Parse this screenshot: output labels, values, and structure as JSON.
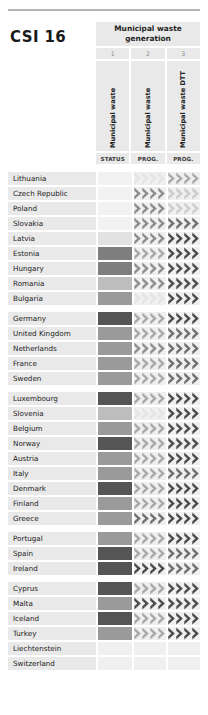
{
  "title": "CSI 16",
  "header": {
    "group_label": "Municipal waste generation",
    "columns": [
      {
        "num": "1",
        "vlabel": "Municipal waste",
        "sub": "STATUS"
      },
      {
        "num": "2",
        "vlabel": "Municipal waste",
        "sub": "PROG."
      },
      {
        "num": "3",
        "vlabel": "Municipal waste DTT",
        "sub": "PROG."
      }
    ]
  },
  "palette": {
    "empty": "#efefef",
    "row_bg": "#e9e9e9",
    "status_0": "#f2f2f2",
    "status_1": "#e2e2e2",
    "status_2": "#bdbdbd",
    "status_3": "#9a9a9a",
    "status_4": "#7e7e7e",
    "status_5": "#555555",
    "chev_0": "#e3e3e3",
    "chev_1": "#cccccc",
    "chev_2": "#a8a8a8",
    "chev_3": "#8c8c8c",
    "chev_4": "#6e6e6e",
    "chev_5": "#4a4a4a"
  },
  "chevron_count": 4,
  "groups": [
    {
      "rows": [
        {
          "name": "Lithuania",
          "status": "status_0",
          "prog1": [
            "chev_0",
            "chev_0",
            "chev_0",
            "chev_0"
          ],
          "prog2": [
            "chev_2",
            "chev_2",
            "chev_2",
            "chev_2"
          ]
        },
        {
          "name": "Czech Republic",
          "status": "status_0",
          "prog1": [
            "chev_3",
            "chev_3",
            "chev_3",
            "chev_3"
          ],
          "prog2": [
            "chev_1",
            "chev_1",
            "chev_1",
            "chev_1"
          ]
        },
        {
          "name": "Poland",
          "status": "status_0",
          "prog1": [
            "chev_3",
            "chev_3",
            "chev_3",
            "chev_3"
          ],
          "prog2": [
            "chev_1",
            "chev_1",
            "chev_1",
            "chev_1"
          ]
        },
        {
          "name": "Slovakia",
          "status": "status_0",
          "prog1": [
            "chev_3",
            "chev_3",
            "chev_3",
            "chev_3"
          ],
          "prog2": [
            "chev_4",
            "chev_4",
            "chev_4",
            "chev_4"
          ]
        },
        {
          "name": "Latvia",
          "status": "status_1",
          "prog1": [
            "chev_3",
            "chev_3",
            "chev_3",
            "chev_3"
          ],
          "prog2": [
            "chev_5",
            "chev_5",
            "chev_5",
            "chev_5"
          ]
        },
        {
          "name": "Estonia",
          "status": "status_4",
          "prog1": [
            "chev_2",
            "chev_2",
            "chev_2",
            "chev_2"
          ],
          "prog2": [
            "chev_5",
            "chev_5",
            "chev_5",
            "chev_5"
          ]
        },
        {
          "name": "Hungary",
          "status": "status_4",
          "prog1": [
            "chev_3",
            "chev_3",
            "chev_3",
            "chev_3"
          ],
          "prog2": [
            "chev_5",
            "chev_5",
            "chev_5",
            "chev_5"
          ]
        },
        {
          "name": "Romania",
          "status": "status_2",
          "prog1": [
            "chev_3",
            "chev_3",
            "chev_3",
            "chev_3"
          ],
          "prog2": [
            "chev_5",
            "chev_5",
            "chev_5",
            "chev_5"
          ]
        },
        {
          "name": "Bulgaria",
          "status": "status_3",
          "prog1": [
            "chev_0",
            "chev_0",
            "chev_0",
            "chev_0"
          ],
          "prog2": [
            "chev_5",
            "chev_5",
            "chev_5",
            "chev_5"
          ]
        }
      ]
    },
    {
      "rows": [
        {
          "name": "Germany",
          "status": "status_5",
          "prog1": [
            "chev_2",
            "chev_2",
            "chev_2",
            "chev_2"
          ],
          "prog2": [
            "chev_5",
            "chev_5",
            "chev_5",
            "chev_5"
          ]
        },
        {
          "name": "United Kingdom",
          "status": "status_3",
          "prog1": [
            "chev_2",
            "chev_2",
            "chev_2",
            "chev_2"
          ],
          "prog2": [
            "chev_4",
            "chev_4",
            "chev_4",
            "chev_4"
          ]
        },
        {
          "name": "Netherlands",
          "status": "status_3",
          "prog1": [
            "chev_3",
            "chev_3",
            "chev_3",
            "chev_3"
          ],
          "prog2": [
            "chev_4",
            "chev_4",
            "chev_4",
            "chev_4"
          ]
        },
        {
          "name": "France",
          "status": "status_3",
          "prog1": [
            "chev_2",
            "chev_2",
            "chev_2",
            "chev_2"
          ],
          "prog2": [
            "chev_4",
            "chev_4",
            "chev_4",
            "chev_4"
          ]
        },
        {
          "name": "Sweden",
          "status": "status_3",
          "prog1": [
            "chev_2",
            "chev_2",
            "chev_2",
            "chev_2"
          ],
          "prog2": [
            "chev_4",
            "chev_4",
            "chev_4",
            "chev_4"
          ]
        }
      ]
    },
    {
      "rows": [
        {
          "name": "Luxembourg",
          "status": "status_5",
          "prog1": [
            "chev_2",
            "chev_2",
            "chev_2",
            "chev_2"
          ],
          "prog2": [
            "chev_5",
            "chev_5",
            "chev_5",
            "chev_5"
          ]
        },
        {
          "name": "Slovenia",
          "status": "status_2",
          "prog1": [
            "chev_0",
            "chev_0",
            "chev_0",
            "chev_0"
          ],
          "prog2": [
            "chev_5",
            "chev_5",
            "chev_5",
            "chev_5"
          ]
        },
        {
          "name": "Belgium",
          "status": "status_3",
          "prog1": [
            "chev_2",
            "chev_2",
            "chev_2",
            "chev_2"
          ],
          "prog2": [
            "chev_5",
            "chev_5",
            "chev_5",
            "chev_5"
          ]
        },
        {
          "name": "Norway",
          "status": "status_5",
          "prog1": [
            "chev_2",
            "chev_2",
            "chev_2",
            "chev_2"
          ],
          "prog2": [
            "chev_5",
            "chev_5",
            "chev_5",
            "chev_5"
          ]
        },
        {
          "name": "Austria",
          "status": "status_3",
          "prog1": [
            "chev_2",
            "chev_2",
            "chev_2",
            "chev_2"
          ],
          "prog2": [
            "chev_5",
            "chev_5",
            "chev_5",
            "chev_5"
          ]
        },
        {
          "name": "Italy",
          "status": "status_3",
          "prog1": [
            "chev_2",
            "chev_2",
            "chev_2",
            "chev_2"
          ],
          "prog2": [
            "chev_4",
            "chev_4",
            "chev_4",
            "chev_4"
          ]
        },
        {
          "name": "Denmark",
          "status": "status_5",
          "prog1": [
            "chev_2",
            "chev_2",
            "chev_2",
            "chev_2"
          ],
          "prog2": [
            "chev_5",
            "chev_5",
            "chev_5",
            "chev_5"
          ]
        },
        {
          "name": "Finland",
          "status": "status_3",
          "prog1": [
            "chev_2",
            "chev_2",
            "chev_2",
            "chev_2"
          ],
          "prog2": [
            "chev_5",
            "chev_5",
            "chev_5",
            "chev_5"
          ]
        },
        {
          "name": "Greece",
          "status": "status_3",
          "prog1": [
            "chev_4",
            "chev_4",
            "chev_4",
            "chev_4"
          ],
          "prog2": [
            "chev_5",
            "chev_5",
            "chev_5",
            "chev_5"
          ]
        }
      ]
    },
    {
      "rows": [
        {
          "name": "Portugal",
          "status": "status_3",
          "prog1": [
            "chev_2",
            "chev_2",
            "chev_2",
            "chev_2"
          ],
          "prog2": [
            "chev_5",
            "chev_5",
            "chev_5",
            "chev_5"
          ]
        },
        {
          "name": "Spain",
          "status": "status_5",
          "prog1": [
            "chev_2",
            "chev_2",
            "chev_2",
            "chev_2"
          ],
          "prog2": [
            "chev_4",
            "chev_4",
            "chev_4",
            "chev_4"
          ]
        },
        {
          "name": "Ireland",
          "status": "status_5",
          "prog1": [
            "chev_5",
            "chev_5",
            "chev_5",
            "chev_5"
          ],
          "prog2": [
            "chev_4",
            "chev_4",
            "chev_4",
            "chev_4"
          ]
        }
      ]
    },
    {
      "rows": [
        {
          "name": "Cyprus",
          "status": "status_5",
          "prog1": [
            "chev_2",
            "chev_2",
            "chev_2",
            "chev_2"
          ],
          "prog2": [
            "chev_5",
            "chev_5",
            "chev_5",
            "chev_5"
          ]
        },
        {
          "name": "Malta",
          "status": "status_3",
          "prog1": [
            "chev_5",
            "chev_5",
            "chev_5",
            "chev_5"
          ],
          "prog2": [
            "chev_5",
            "chev_5",
            "chev_5",
            "chev_5"
          ]
        },
        {
          "name": "Iceland",
          "status": "status_5",
          "prog1": [
            "chev_2",
            "chev_2",
            "chev_2",
            "chev_2"
          ],
          "prog2": [
            "chev_5",
            "chev_5",
            "chev_5",
            "chev_5"
          ]
        },
        {
          "name": "Turkey",
          "status": "status_3",
          "prog1": [
            "chev_2",
            "chev_2",
            "chev_2",
            "chev_2"
          ],
          "prog2": [
            "chev_5",
            "chev_5",
            "chev_5",
            "chev_5"
          ]
        },
        {
          "name": "Liechtenstein",
          "status": "empty",
          "prog1": [],
          "prog2": []
        },
        {
          "name": "Switzerland",
          "status": "empty",
          "prog1": [],
          "prog2": []
        }
      ]
    }
  ]
}
